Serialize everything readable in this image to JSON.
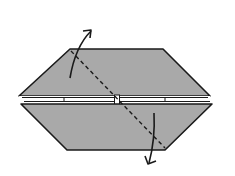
{
  "diagram": {
    "type": "origami-fold-step",
    "colors": {
      "paper": "#a9a9a9",
      "outline": "#1a1a1a",
      "background": "#ffffff",
      "inner_gap": "#ffffff"
    },
    "elements": {
      "upper_flap": "upper-trapezoid-flap",
      "lower_flap": "lower-trapezoid-flap",
      "fold_line": "dashed-diagonal-valley-fold",
      "arrow_up": "curved-arrow-up-right",
      "arrow_down": "curved-arrow-down-left"
    }
  }
}
